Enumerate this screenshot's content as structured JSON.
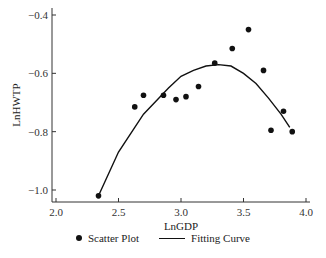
{
  "chart_data": {
    "type": "scatter",
    "title": "",
    "xlabel": "LnGDP",
    "ylabel": "LnHWTP",
    "xlim": [
      2.0,
      4.0
    ],
    "ylim": [
      -1.05,
      -0.4
    ],
    "xticks": [
      2.0,
      2.5,
      3.0,
      3.5,
      4.0
    ],
    "yticks": [
      -0.4,
      -0.6,
      -0.8,
      -1.0
    ],
    "grid": false,
    "legend_position": "bottom",
    "series": [
      {
        "name": "Scatter Plot",
        "kind": "scatter",
        "points": [
          [
            2.34,
            -1.02
          ],
          [
            2.63,
            -0.715
          ],
          [
            2.7,
            -0.675
          ],
          [
            2.86,
            -0.675
          ],
          [
            2.96,
            -0.69
          ],
          [
            3.04,
            -0.68
          ],
          [
            3.14,
            -0.645
          ],
          [
            3.27,
            -0.565
          ],
          [
            3.41,
            -0.515
          ],
          [
            3.54,
            -0.45
          ],
          [
            3.66,
            -0.59
          ],
          [
            3.72,
            -0.795
          ],
          [
            3.82,
            -0.73
          ],
          [
            3.89,
            -0.8
          ]
        ]
      },
      {
        "name": "Fitting Curve",
        "kind": "line",
        "points": [
          [
            2.34,
            -1.02
          ],
          [
            2.5,
            -0.87
          ],
          [
            2.7,
            -0.74
          ],
          [
            2.9,
            -0.65
          ],
          [
            3.0,
            -0.61
          ],
          [
            3.1,
            -0.59
          ],
          [
            3.2,
            -0.575
          ],
          [
            3.3,
            -0.57
          ],
          [
            3.4,
            -0.575
          ],
          [
            3.5,
            -0.6
          ],
          [
            3.6,
            -0.635
          ],
          [
            3.7,
            -0.685
          ],
          [
            3.8,
            -0.74
          ],
          [
            3.87,
            -0.785
          ]
        ]
      }
    ]
  },
  "legend": {
    "scatter_label": "Scatter Plot",
    "line_label": "Fitting Curve"
  }
}
